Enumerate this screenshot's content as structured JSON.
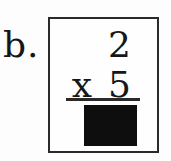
{
  "problem": {
    "item_label": "b.",
    "top_operand": "2",
    "operator": "x",
    "bottom_operand": "5"
  },
  "answer": {
    "hidden": true,
    "box_color": "#0e0e0e"
  },
  "colors": {
    "ink": "#161616",
    "card_border": "#2a2a2a",
    "background": "#fdfdfd"
  }
}
